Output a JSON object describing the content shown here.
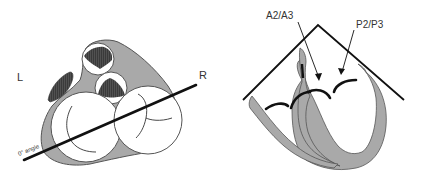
{
  "left_view": {
    "label_left": "L",
    "label_right": "R",
    "angle_label": "0° angle"
  },
  "right_view": {
    "label_a": "A2/A3",
    "label_p": "P2/P3"
  },
  "colors": {
    "tissue": "#a9a9a9",
    "outline": "#555555",
    "line": "#111111",
    "hatch": "#3c3c3c",
    "background": "#ffffff"
  }
}
